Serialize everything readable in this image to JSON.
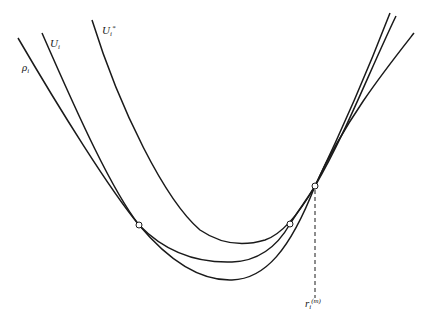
{
  "diagram": {
    "type": "curves-with-tangent-points",
    "curves": [
      {
        "id": "rho",
        "label_base": "ρ",
        "label_sub": "i",
        "label_sup": "",
        "color": "#1a1a1a"
      },
      {
        "id": "U",
        "label_base": "U",
        "label_sub": "i",
        "label_sup": "",
        "color": "#1a1a1a"
      },
      {
        "id": "Ustar",
        "label_base": "U",
        "label_sub": "i",
        "label_sup": "*",
        "color": "#1a1a1a"
      }
    ],
    "marker": {
      "label_base": "r",
      "label_sub": "i",
      "label_sup": "(m)"
    },
    "points": [
      {
        "name": "tangent-left",
        "x": 139,
        "y": 225
      },
      {
        "name": "tangent-right",
        "x": 290,
        "y": 224
      },
      {
        "name": "tangent-top",
        "x": 315,
        "y": 186
      }
    ]
  }
}
